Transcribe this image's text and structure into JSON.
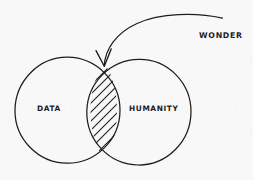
{
  "diagram": {
    "type": "venn",
    "title": "",
    "style": "hand-drawn sketch on paper",
    "background_color": "#f8f8f8",
    "ink_color": "#1d1d1d",
    "sets": [
      {
        "id": "data",
        "label": "DATA",
        "position": "left",
        "center": [
          67,
          110
        ],
        "radius": 53
      },
      {
        "id": "humanity",
        "label": "HUMANITY",
        "position": "right",
        "center": [
          139,
          112
        ],
        "radius": 52
      }
    ],
    "intersection": {
      "label": "",
      "fill": "diagonal-hatching",
      "hatch_line_count": 10,
      "hatch_angle_deg": 45,
      "annotated_by": "wonder"
    },
    "annotations": [
      {
        "id": "wonder",
        "label": "WONDER",
        "label_position": [
          199,
          31
        ],
        "connector": "curved-arrow",
        "arrow_from": [
          222,
          18
        ],
        "arrow_to": [
          104,
          66
        ],
        "arrowhead": "open-v",
        "points_to": "intersection"
      }
    ]
  }
}
